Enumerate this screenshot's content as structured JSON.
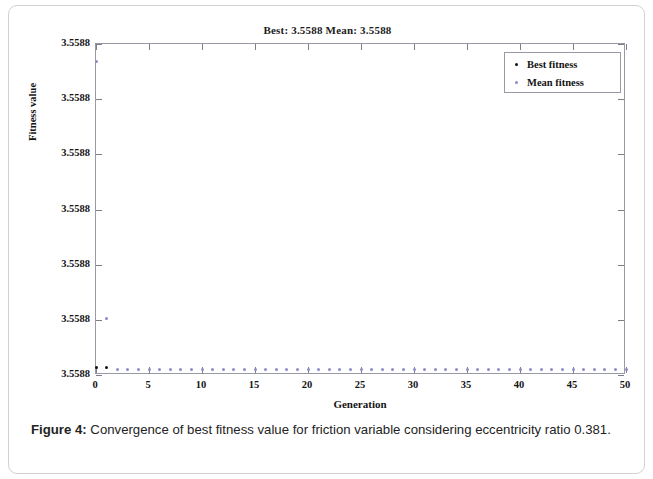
{
  "figure": {
    "caption_label": "Figure 4:",
    "caption_text": " Convergence of best fitness value for friction variable considering eccentricity ratio 0.381."
  },
  "legend": {
    "position": "top-right",
    "items": [
      {
        "label": "Best fitness",
        "color": "#111118",
        "marker": "dot"
      },
      {
        "label": "Mean fitness",
        "color": "#8b8bc8",
        "marker": "dot"
      }
    ]
  },
  "chart_data": {
    "type": "scatter",
    "title": "Best: 3.5588 Mean: 3.5588",
    "xlabel": "Generation",
    "ylabel": "Fitness value",
    "grid": false,
    "xlim": [
      0,
      50
    ],
    "ylim": [
      0,
      6
    ],
    "xticks": [
      0,
      5,
      10,
      15,
      20,
      25,
      30,
      35,
      40,
      45,
      50
    ],
    "xticklabels": [
      "0",
      "5",
      "10",
      "15",
      "20",
      "25",
      "30",
      "35",
      "40",
      "45",
      "50"
    ],
    "yticks": [
      6,
      5,
      4,
      3,
      2,
      1,
      0
    ],
    "yticklabels": [
      "3.5588",
      "3.5588",
      "3.5588",
      "3.5588",
      "3.5588",
      "3.5588",
      "3.5588"
    ],
    "series": [
      {
        "name": "Best fitness",
        "color": "#111118",
        "x": [
          0,
          1
        ],
        "y": [
          0.13,
          0.13
        ]
      },
      {
        "name": "Mean fitness",
        "color": "#8b8bc8",
        "x": [
          0,
          1,
          2,
          3,
          4,
          5,
          6,
          7,
          8,
          9,
          10,
          11,
          12,
          13,
          14,
          15,
          16,
          17,
          18,
          19,
          20,
          21,
          22,
          23,
          24,
          25,
          26,
          27,
          28,
          29,
          30,
          31,
          32,
          33,
          34,
          35,
          36,
          37,
          38,
          39,
          40,
          41,
          42,
          43,
          44,
          45,
          46,
          47,
          48,
          49,
          50
        ],
        "y": [
          5.68,
          1.02,
          0.1,
          0.1,
          0.1,
          0.1,
          0.1,
          0.1,
          0.1,
          0.1,
          0.1,
          0.1,
          0.1,
          0.1,
          0.1,
          0.1,
          0.1,
          0.1,
          0.1,
          0.1,
          0.1,
          0.1,
          0.1,
          0.1,
          0.1,
          0.1,
          0.1,
          0.1,
          0.1,
          0.1,
          0.1,
          0.1,
          0.1,
          0.1,
          0.1,
          0.1,
          0.1,
          0.1,
          0.1,
          0.1,
          0.1,
          0.1,
          0.1,
          0.1,
          0.1,
          0.1,
          0.1,
          0.1,
          0.1,
          0.1,
          0.1
        ]
      }
    ]
  }
}
